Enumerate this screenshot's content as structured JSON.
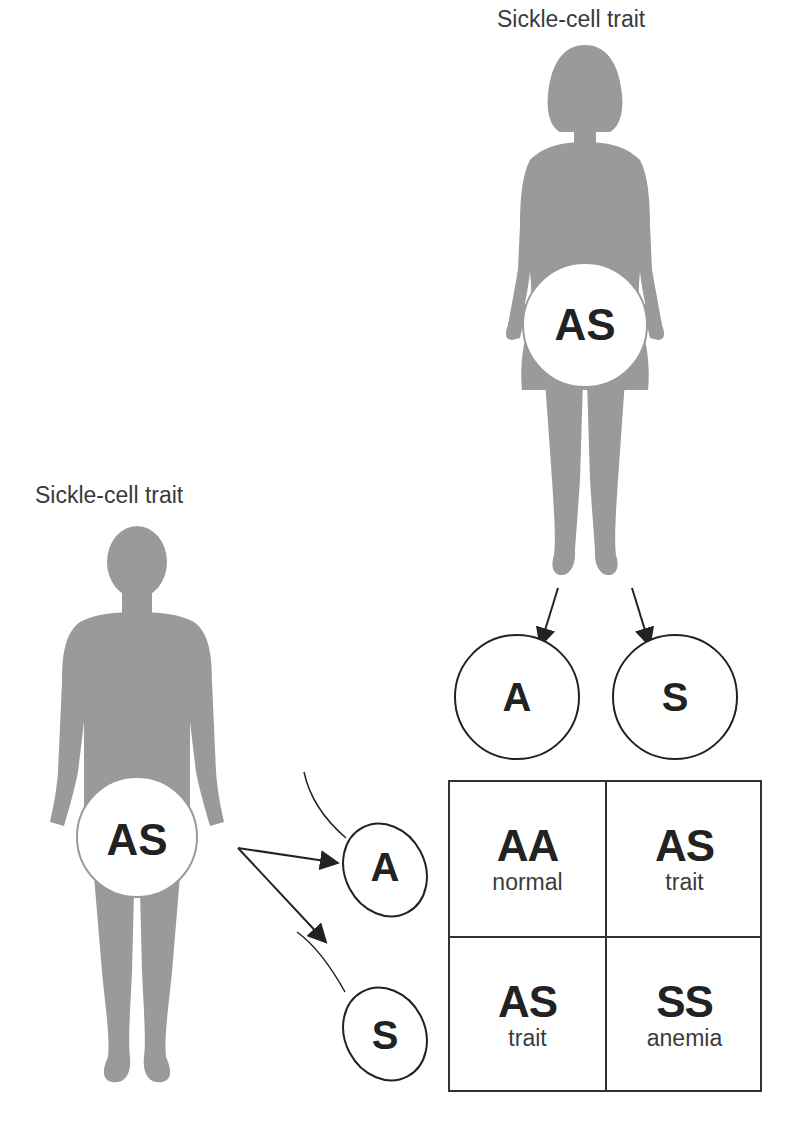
{
  "mother": {
    "label": "Sickle-cell trait",
    "genotype": "AS"
  },
  "father": {
    "label": "Sickle-cell trait",
    "genotype": "AS"
  },
  "egg_alleles": [
    "A",
    "S"
  ],
  "sperm_alleles": [
    "A",
    "S"
  ],
  "punnett": {
    "cells": [
      {
        "genotype": "AA",
        "phenotype": "normal"
      },
      {
        "genotype": "AS",
        "phenotype": "trait"
      },
      {
        "genotype": "AS",
        "phenotype": "trait"
      },
      {
        "genotype": "SS",
        "phenotype": "anemia"
      }
    ]
  },
  "colors": {
    "silhouette": "#9a9a9a",
    "line": "#222222",
    "background": "#ffffff"
  }
}
